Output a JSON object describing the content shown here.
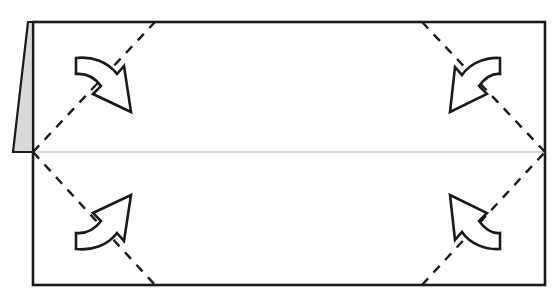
{
  "figure": {
    "canvas": {
      "width": 554,
      "height": 308
    },
    "background_color": "#ffffff"
  },
  "colors": {
    "paper_fill": "#ffffff",
    "outline": "#1a1a1a",
    "flap_fill": "#d9d9d9",
    "flap_outline": "#1a1a1a",
    "center_line": "#b0b0b0",
    "fold_line": "#1a1a1a",
    "arrow_outline": "#1a1a1a",
    "arrow_fill": "#ffffff"
  },
  "geometry": {
    "sheet": {
      "left": 33,
      "top": 22,
      "right": 545,
      "bottom": 285,
      "stroke_width": 2.6
    },
    "center_line": {
      "x1": 33,
      "y1": 152,
      "x2": 545,
      "y2": 152,
      "stroke_width": 1.1
    },
    "left_flap": {
      "points": "28,22 13,152 33,152 33,22",
      "stroke_width": 2.2
    },
    "vertices": {
      "left_mid": {
        "x": 33,
        "y": 152
      },
      "right_mid": {
        "x": 545,
        "y": 152
      },
      "top_left_break": {
        "x": 155,
        "y": 22
      },
      "top_right_break": {
        "x": 422,
        "y": 22
      },
      "bottom_left_break": {
        "x": 155,
        "y": 285
      },
      "bottom_right_break": {
        "x": 422,
        "y": 285
      }
    },
    "fold_lines": [
      {
        "name": "fold-top-left",
        "x1": 33,
        "y1": 152,
        "x2": 155,
        "y2": 22,
        "dash": "9 8",
        "stroke_width": 2.4
      },
      {
        "name": "fold-top-right",
        "x1": 422,
        "y1": 22,
        "x2": 545,
        "y2": 152,
        "dash": "9 8",
        "stroke_width": 2.4
      },
      {
        "name": "fold-bottom-left",
        "x1": 33,
        "y1": 152,
        "x2": 155,
        "y2": 285,
        "dash": "9 8",
        "stroke_width": 2.4
      },
      {
        "name": "fold-bottom-right",
        "x1": 422,
        "y1": 285,
        "x2": 545,
        "y2": 152,
        "dash": "9 8",
        "stroke_width": 2.4
      }
    ],
    "arrows": [
      {
        "name": "fold-arrow-top-left",
        "direction": "down-right",
        "anchor": {
          "x": 104,
          "y": 85
        },
        "path": "M 76,58 C 92,56 108,62 117,74 L 124,66 L 131,112 L 93,94 L 101,86 C 95,78 86,73 76,74 Z",
        "stroke_width": 2.6
      },
      {
        "name": "fold-arrow-top-right",
        "direction": "down-left",
        "anchor": {
          "x": 478,
          "y": 85
        },
        "path": "M 500,58 C 486,57 470,63 462,75 L 455,67 L 450,112 L 487,94 L 479,86 C 485,78 492,73 500,74 Z",
        "stroke_width": 2.6
      },
      {
        "name": "fold-arrow-bottom-left",
        "direction": "up-right",
        "anchor": {
          "x": 104,
          "y": 220
        },
        "path": "M 76,249 C 92,251 108,245 117,233 L 124,241 L 131,195 L 93,213 L 101,221 C 95,229 86,234 76,233 Z",
        "stroke_width": 2.6
      },
      {
        "name": "fold-arrow-bottom-right",
        "direction": "up-left",
        "anchor": {
          "x": 478,
          "y": 220
        },
        "path": "M 500,249 C 486,250 470,244 462,232 L 455,240 L 450,195 L 487,213 L 479,221 C 485,229 492,234 500,233 Z",
        "stroke_width": 2.6
      }
    ]
  },
  "labels": {
    "sheet": "folded-paper-sheet",
    "flap": "raised-left-flap",
    "center": "horizontal-center-crease",
    "fold_group": "valley-fold-lines",
    "arrow_group": "fold-direction-arrows"
  }
}
